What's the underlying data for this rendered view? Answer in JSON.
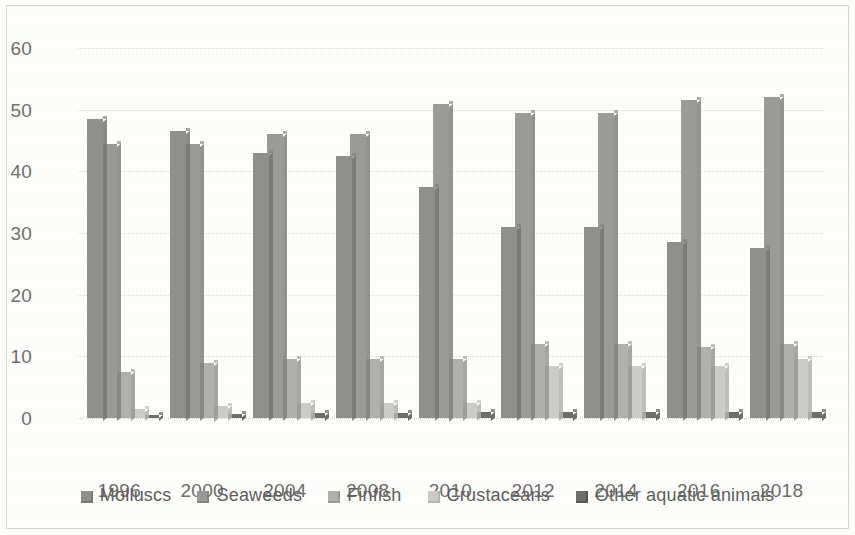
{
  "chart_data": {
    "type": "bar",
    "title": "",
    "subtitle": "",
    "xlabel": "",
    "ylabel": "",
    "categories": [
      "1996",
      "2000",
      "2004",
      "2008",
      "2010",
      "2012",
      "2014",
      "2016",
      "2018"
    ],
    "series": [
      {
        "name": "Molluscs",
        "color": "#8f8f8d",
        "values": [
          48.5,
          46.5,
          43.0,
          42.5,
          37.5,
          31.0,
          31.0,
          28.5,
          27.5
        ]
      },
      {
        "name": "Seaweeds",
        "color": "#9a9a98",
        "values": [
          44.5,
          44.5,
          46.0,
          46.0,
          51.0,
          49.5,
          49.5,
          51.5,
          52.0
        ]
      },
      {
        "name": "Finfish",
        "color": "#b0b0ae",
        "values": [
          7.5,
          9.0,
          9.5,
          9.5,
          9.5,
          12.0,
          12.0,
          11.5,
          12.0
        ]
      },
      {
        "name": "Crustaceans",
        "color": "#cbcbc8",
        "values": [
          1.5,
          2.0,
          2.5,
          2.5,
          2.5,
          8.5,
          8.5,
          8.5,
          9.5
        ]
      },
      {
        "name": "Other aquatic animals",
        "color": "#6e6e6c",
        "values": [
          0.5,
          0.6,
          0.8,
          0.8,
          1.0,
          1.0,
          1.0,
          1.0,
          1.0
        ]
      }
    ],
    "ylim": [
      0,
      60
    ],
    "yticks": [
      0,
      10,
      20,
      30,
      40,
      50,
      60
    ],
    "ytick_labels": [
      "0",
      "10",
      "20",
      "30",
      "40",
      "50",
      "60"
    ],
    "grid": true,
    "grid_axis": "y",
    "grid_style": "dotted",
    "legend_position": "bottom",
    "bar_style": "clustered-3d",
    "background_color": "#fefefd",
    "grid_color": "#dcdbd7",
    "text_color": "#6f6f6d"
  }
}
